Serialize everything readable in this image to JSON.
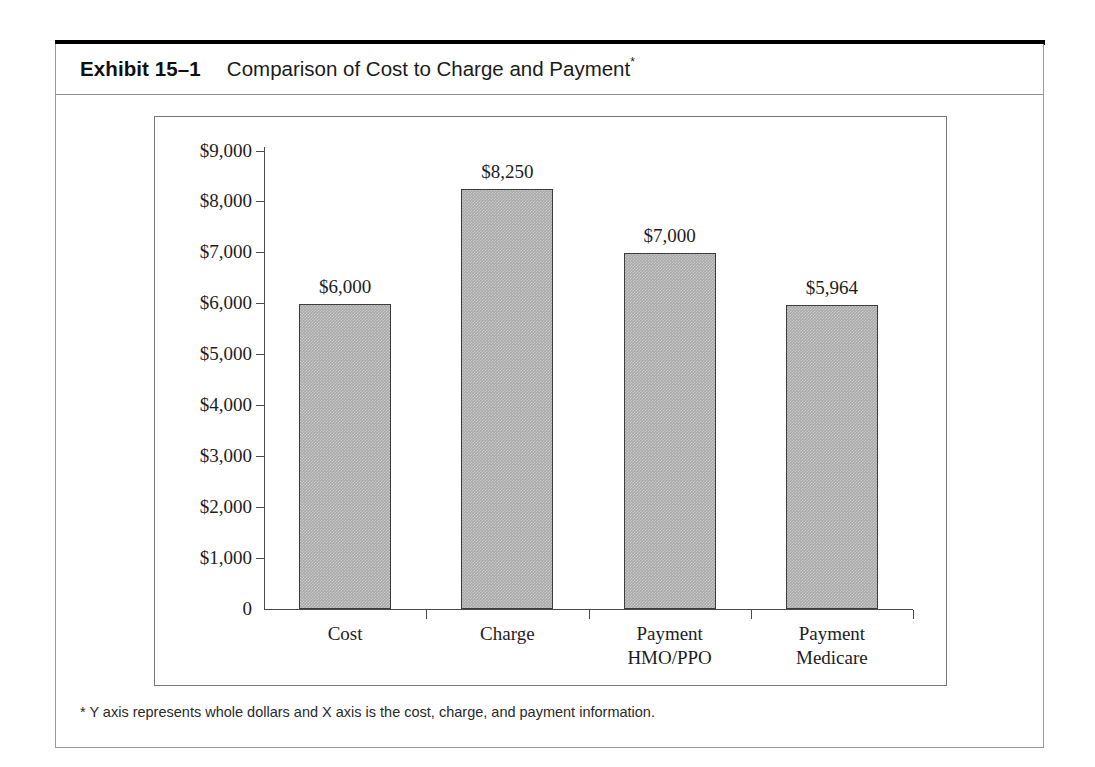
{
  "exhibit": {
    "number_label": "Exhibit 15–1",
    "title": "Comparison of Cost to Charge and Payment",
    "title_marker": "*",
    "footnote": "* Y axis represents whole dollars and X axis is the cost, charge, and payment information."
  },
  "chart_data": {
    "type": "bar",
    "title": "Comparison of Cost to Charge and Payment",
    "categories": [
      "Cost",
      "Charge",
      "Payment HMO/PPO",
      "Payment Medicare"
    ],
    "category_lines": [
      [
        "Cost",
        ""
      ],
      [
        "Charge",
        ""
      ],
      [
        "Payment",
        "HMO/PPO"
      ],
      [
        "Payment",
        "Medicare"
      ]
    ],
    "values": [
      6000,
      8250,
      7000,
      5964
    ],
    "value_labels": [
      "$6,000",
      "$8,250",
      "$7,000",
      "$5,964"
    ],
    "xlabel": "",
    "ylabel": "",
    "ylim": [
      0,
      9000
    ],
    "ytick_values": [
      9000,
      8000,
      7000,
      6000,
      5000,
      4000,
      3000,
      2000,
      1000,
      0
    ],
    "ytick_labels": [
      "$9,000",
      "$8,000",
      "$7,000",
      "$6,000",
      "$5,000",
      "$4,000",
      "$3,000",
      "$2,000",
      "$1,000",
      "0"
    ],
    "grid": false,
    "legend": null,
    "bar_fill_color": "#a9a9a9",
    "bar_border_color": "#3c3c3c",
    "axis_color": "#4a4a4a"
  }
}
